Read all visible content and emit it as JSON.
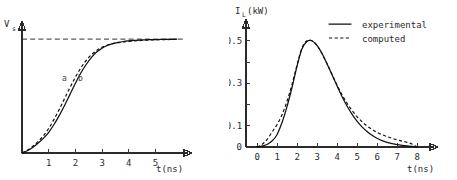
{
  "figure": {
    "panels": [
      {
        "id": "left",
        "y_axis_label": "V",
        "y_axis_label_sub": "s",
        "x_axis_label": "t(ns)",
        "x_ticks": [
          "1",
          "2",
          "3",
          "4",
          "5"
        ],
        "curve_labels": [
          "a",
          "b"
        ],
        "asymptote_note": "Vs"
      },
      {
        "id": "right",
        "y_axis_label": "I",
        "y_axis_label_sub": "L",
        "y_axis_label_unit": "(kW)",
        "x_axis_label": "t(ns)",
        "x_ticks": [
          "0",
          "1",
          "2",
          "3",
          "4",
          "5",
          "6",
          "7",
          "8"
        ],
        "y_ticks": [
          "0",
          "0.1",
          "0.3",
          "0.5"
        ],
        "legend": [
          {
            "label": "experimental",
            "style": "solid"
          },
          {
            "label": "computed",
            "style": "dashed"
          }
        ]
      }
    ]
  },
  "chart_data": [
    {
      "type": "line",
      "id": "left-panel-source-voltage",
      "title": "",
      "xlabel": "t(ns)",
      "ylabel": "Vs",
      "xlim": [
        0,
        6
      ],
      "ylim": [
        0,
        1.08
      ],
      "grid": false,
      "legend_position": "inline-curve-labels",
      "xticks": [
        1,
        2,
        3,
        4,
        5
      ],
      "yticks": [],
      "annotations": [
        {
          "text": "a",
          "x": 1.75,
          "y": 0.56
        },
        {
          "text": "b",
          "x": 2.15,
          "y": 0.56
        },
        {
          "text": "Vs asymptote (horizontal dashed line at y=1.0)",
          "x": 0,
          "y": 1.0
        }
      ],
      "x": [
        0,
        0.2,
        0.4,
        0.6,
        0.8,
        1.0,
        1.2,
        1.4,
        1.6,
        1.8,
        2.0,
        2.2,
        2.4,
        2.6,
        2.8,
        3.0,
        3.2,
        3.4,
        3.6,
        3.8,
        4.0,
        4.2,
        4.4,
        4.6,
        4.8,
        5.0,
        5.2,
        5.4,
        5.6,
        5.8
      ],
      "series": [
        {
          "name": "a",
          "style": "dashed",
          "values": [
            0.0,
            0.025,
            0.058,
            0.1,
            0.15,
            0.215,
            0.295,
            0.385,
            0.48,
            0.575,
            0.665,
            0.745,
            0.81,
            0.862,
            0.9,
            0.928,
            0.947,
            0.96,
            0.969,
            0.975,
            0.98,
            0.984,
            0.987,
            0.99,
            0.992,
            0.994,
            0.995,
            0.996,
            0.997,
            0.998
          ]
        },
        {
          "name": "b",
          "style": "solid",
          "values": [
            0.0,
            0.02,
            0.048,
            0.085,
            0.128,
            0.182,
            0.25,
            0.33,
            0.42,
            0.515,
            0.61,
            0.7,
            0.775,
            0.838,
            0.886,
            0.92,
            0.944,
            0.96,
            0.971,
            0.979,
            0.984,
            0.988,
            0.991,
            0.993,
            0.995,
            0.996,
            0.997,
            0.998,
            0.998,
            0.999
          ]
        }
      ]
    },
    {
      "type": "line",
      "id": "right-panel-load-current",
      "title": "",
      "xlabel": "t(ns)",
      "ylabel": "IL(kW)",
      "xlim": [
        -0.55,
        8.6
      ],
      "ylim": [
        0,
        0.56
      ],
      "grid": false,
      "legend_position": "top-right",
      "xticks": [
        0,
        1,
        2,
        3,
        4,
        5,
        6,
        7,
        8
      ],
      "yticks": [
        0,
        0.1,
        0.2,
        0.3,
        0.4,
        0.5
      ],
      "ytick_labels": [
        "0",
        "0.1",
        "",
        "0.3",
        "",
        "0.5"
      ],
      "x": [
        0,
        0.25,
        0.5,
        0.75,
        1.0,
        1.25,
        1.5,
        1.75,
        2.0,
        2.25,
        2.5,
        2.75,
        3.0,
        3.25,
        3.5,
        3.75,
        4.0,
        4.25,
        4.5,
        4.75,
        5.0,
        5.25,
        5.5,
        5.75,
        6.0,
        6.25,
        6.5,
        6.75,
        7.0,
        7.25,
        7.5,
        7.75,
        8.0
      ],
      "series": [
        {
          "name": "experimental",
          "style": "solid",
          "values": [
            0.0,
            0.004,
            0.012,
            0.028,
            0.058,
            0.115,
            0.19,
            0.28,
            0.38,
            0.462,
            0.497,
            0.5,
            0.478,
            0.44,
            0.392,
            0.34,
            0.288,
            0.238,
            0.193,
            0.155,
            0.122,
            0.095,
            0.073,
            0.055,
            0.041,
            0.03,
            0.022,
            0.016,
            0.011,
            0.0075,
            0.005,
            0.003,
            0.0
          ]
        },
        {
          "name": "computed",
          "style": "dashed",
          "values": [
            0.0,
            0.012,
            0.035,
            0.07,
            0.105,
            0.152,
            0.215,
            0.295,
            0.385,
            0.466,
            0.5,
            0.5,
            0.478,
            0.44,
            0.392,
            0.342,
            0.292,
            0.246,
            0.206,
            0.172,
            0.143,
            0.119,
            0.099,
            0.083,
            0.069,
            0.058,
            0.049,
            0.041,
            0.034,
            0.028,
            0.022,
            0.014,
            0.0
          ]
        }
      ]
    }
  ]
}
